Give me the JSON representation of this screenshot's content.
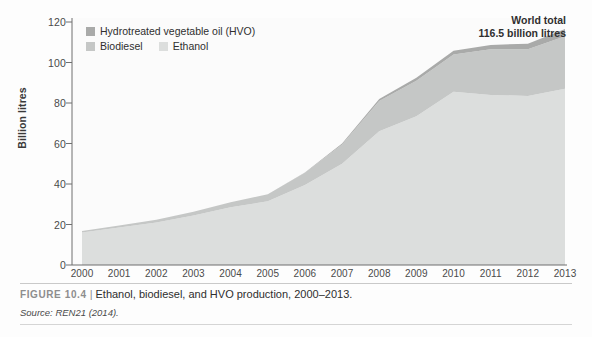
{
  "figure": {
    "number": "FIGURE 10.4",
    "separator": "|",
    "title": "Ethanol, biodiesel, and HVO production, 2000–2013.",
    "source": "Source: REN21 (2014)."
  },
  "annotation": {
    "line1": "World total",
    "line2": "116.5 billion litres"
  },
  "colors": {
    "hvo": "#a9aaa9",
    "biodiesel": "#c5c7c6",
    "ethanol": "#dcdedd",
    "plot_background": "#fbfbfb",
    "axis": "#6e6e6e",
    "gridline": "#ededed"
  },
  "chart_data": {
    "type": "area",
    "stacked": true,
    "title": "Ethanol, biodiesel, and HVO production, 2000–2013",
    "xlabel": "",
    "ylabel": "Billion litres",
    "ylim": [
      0,
      120
    ],
    "yticks": [
      0,
      20,
      40,
      60,
      80,
      100,
      120
    ],
    "grid": false,
    "legend_position": "top-left",
    "x": [
      2000,
      2001,
      2002,
      2003,
      2004,
      2005,
      2006,
      2007,
      2008,
      2009,
      2010,
      2011,
      2012,
      2013
    ],
    "categories": [
      "2000",
      "2001",
      "2002",
      "2003",
      "2004",
      "2005",
      "2006",
      "2007",
      "2008",
      "2009",
      "2010",
      "2011",
      "2012",
      "2013"
    ],
    "series": [
      {
        "name": "Ethanol",
        "color": "#dcdedd",
        "values": [
          16.0,
          18.5,
          21.0,
          24.5,
          28.5,
          31.5,
          39.5,
          50.0,
          66.0,
          73.5,
          85.5,
          84.0,
          83.5,
          87.0
        ]
      },
      {
        "name": "Biodiesel",
        "color": "#c5c7c6",
        "values": [
          0.8,
          1.0,
          1.3,
          1.8,
          2.5,
          3.5,
          6.0,
          9.5,
          15.0,
          17.5,
          18.5,
          22.5,
          23.0,
          26.0
        ]
      },
      {
        "name": "Hydrotreated vegetable oil (HVO)",
        "color": "#a9aaa9",
        "values": [
          0.0,
          0.0,
          0.0,
          0.0,
          0.0,
          0.0,
          0.2,
          0.5,
          1.0,
          1.5,
          1.8,
          2.2,
          2.8,
          3.5
        ]
      }
    ],
    "totals": [
      16.8,
      19.5,
      22.3,
      26.3,
      31.0,
      35.0,
      45.7,
      60.0,
      82.0,
      92.5,
      105.8,
      108.7,
      109.3,
      116.5
    ],
    "annotations": [
      {
        "text": "World total 116.5 billion litres",
        "at_x": 2013
      }
    ]
  },
  "legend": {
    "items": [
      {
        "label": "Hydrotreated vegetable oil (HVO)",
        "swatch": "#a9aaa9"
      },
      {
        "label": "Biodiesel",
        "swatch": "#c5c7c6"
      },
      {
        "label": "Ethanol",
        "swatch": "#dcdedd"
      }
    ]
  },
  "axes": {
    "y_title": "Billion litres",
    "y_ticks": [
      "0",
      "20",
      "40",
      "60",
      "80",
      "100",
      "120"
    ],
    "x_ticks": [
      "2000",
      "2001",
      "2002",
      "2003",
      "2004",
      "2005",
      "2006",
      "2007",
      "2008",
      "2009",
      "2010",
      "2011",
      "2012",
      "2013"
    ]
  }
}
